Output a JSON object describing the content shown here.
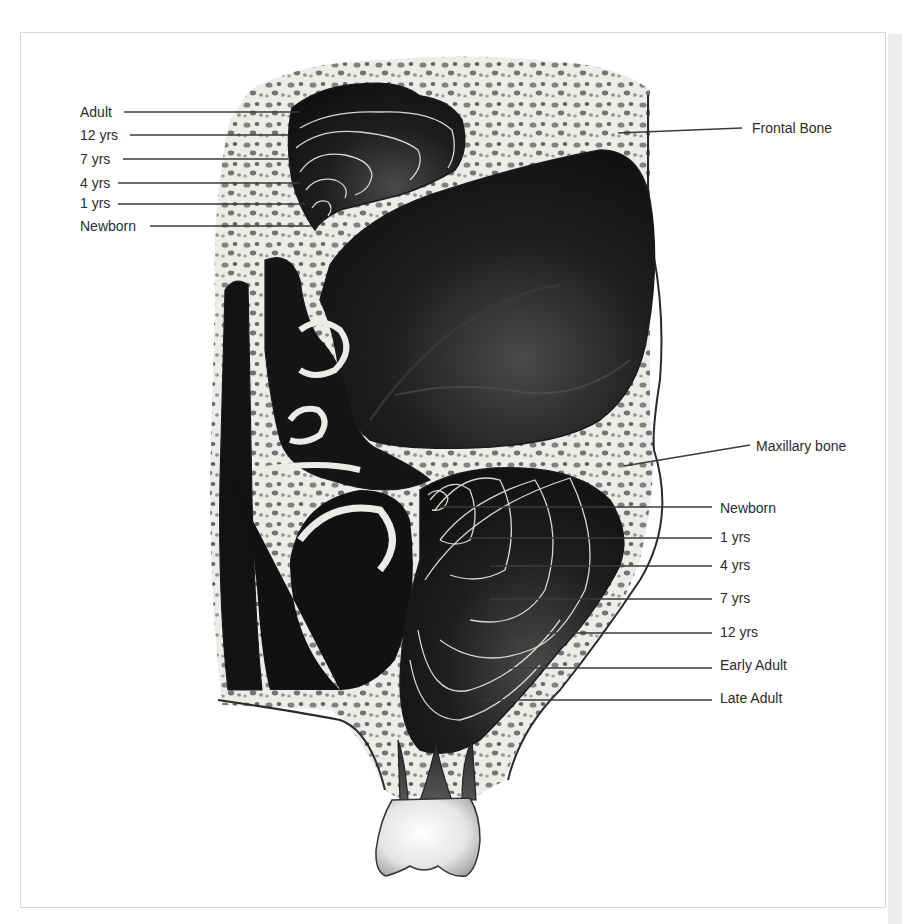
{
  "figure": {
    "colors": {
      "cavity": "#121212",
      "cavity_highlight": "#4a4a4a",
      "bone": "#ecebe7",
      "bone_pore": "#6c6c6c",
      "outline": "#2a2a2a",
      "growth_line": "#d8d8d0",
      "leader_line": "#3a3a3a",
      "text": "#2b2b2b",
      "tooth": "#f4f4f2"
    }
  },
  "labels_left": [
    {
      "text": "Adult",
      "x": 80,
      "y": 104,
      "line_from": 124,
      "line_to": 300,
      "line_y": 112
    },
    {
      "text": "12 yrs",
      "x": 80,
      "y": 127,
      "line_from": 130,
      "line_to": 288,
      "line_y": 135
    },
    {
      "text": "7 yrs",
      "x": 80,
      "y": 151,
      "line_from": 123,
      "line_to": 288,
      "line_y": 159
    },
    {
      "text": "4 yrs",
      "x": 80,
      "y": 175,
      "line_from": 118,
      "line_to": 300,
      "line_y": 183
    },
    {
      "text": "1 yrs",
      "x": 80,
      "y": 195,
      "line_from": 118,
      "line_to": 305,
      "line_y": 204
    },
    {
      "text": "Newborn",
      "x": 80,
      "y": 218,
      "line_from": 150,
      "line_to": 310,
      "line_y": 226
    }
  ],
  "labels_right": [
    {
      "text": "Frontal Bone",
      "x": 752,
      "y": 120,
      "line_from": 618,
      "line_to": 742,
      "line_y1": 133,
      "line_y2": 128
    },
    {
      "text": "Maxillary bone",
      "x": 756,
      "y": 440,
      "line_from": 624,
      "line_to": 750,
      "line_y1": 466,
      "line_y2": 445
    },
    {
      "text": "Newborn",
      "x": 720,
      "y": 500,
      "line_from": 440,
      "line_to": 712,
      "line_y": 507
    },
    {
      "text": "1 yrs",
      "x": 720,
      "y": 528,
      "line_from": 468,
      "line_to": 712,
      "line_y": 538
    },
    {
      "text": "4 yrs",
      "x": 720,
      "y": 557,
      "line_from": 490,
      "line_to": 712,
      "line_y": 566
    },
    {
      "text": "7 yrs",
      "x": 720,
      "y": 590,
      "line_from": 490,
      "line_to": 712,
      "line_y": 599
    },
    {
      "text": "12 yrs",
      "x": 720,
      "y": 624,
      "line_from": 508,
      "line_to": 712,
      "line_y": 633
    },
    {
      "text": "Early Adult",
      "x": 720,
      "y": 657,
      "line_from": 498,
      "line_to": 712,
      "line_y": 668
    },
    {
      "text": "Late Adult",
      "x": 720,
      "y": 690,
      "line_from": 482,
      "line_to": 712,
      "line_y": 700
    }
  ]
}
